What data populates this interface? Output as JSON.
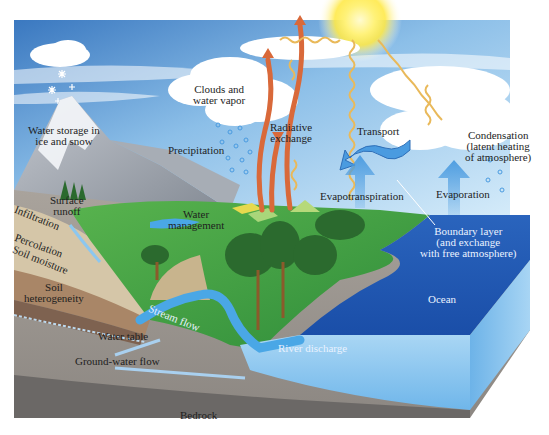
{
  "diagram": {
    "colors": {
      "sky_top": "#3f7fc4",
      "sky_light": "#bcdcf3",
      "sun": "#ffe94a",
      "cloud": "#ffffff",
      "mountain": "#9aa1ab",
      "snow": "#f4f6fa",
      "grass": "#3fa446",
      "forest": "#2b6a2e",
      "ocean_deep": "#1c55b4",
      "ocean_side": "#8cc7ef",
      "soil_tan": "#cbb79a",
      "soil_brown": "#8d6d55",
      "rock_gray": "#8f8a86",
      "bedrock": "#6b6866",
      "radiative_arrow": "#d9693a",
      "wavy_arrow": "#e9b95a",
      "transport_arrow": "#4a9be0",
      "river": "#4aa7e6"
    },
    "labels": {
      "water_storage": [
        "Water storage in",
        "ice and snow"
      ],
      "clouds": [
        "Clouds and",
        "water vapor"
      ],
      "precipitation": "Precipitation",
      "radiative": [
        "Radiative",
        "exchange"
      ],
      "transport": "Transport",
      "condensation": [
        "Condensation",
        "(latent heating",
        "of atmosphere)"
      ],
      "surface_runoff": [
        "Surface",
        "runoff"
      ],
      "infiltration": "Infiltration",
      "percolation": "Percolation",
      "soil_moisture": "Soil moisture",
      "water_management": [
        "Water",
        "management"
      ],
      "evapotranspiration": "Evapotranspiration",
      "evaporation": "Evaporation",
      "boundary_layer": [
        "Boundary layer",
        "(and exchange",
        "with free atmosphere)"
      ],
      "soil_heterogeneity": [
        "Soil",
        "heterogeneity"
      ],
      "stream_flow": "Stream flow",
      "ocean": "Ocean",
      "water_table": "Water table",
      "river_discharge": "River discharge",
      "ground_water_flow": "Ground-water flow",
      "bedrock": "Bedrock"
    }
  }
}
